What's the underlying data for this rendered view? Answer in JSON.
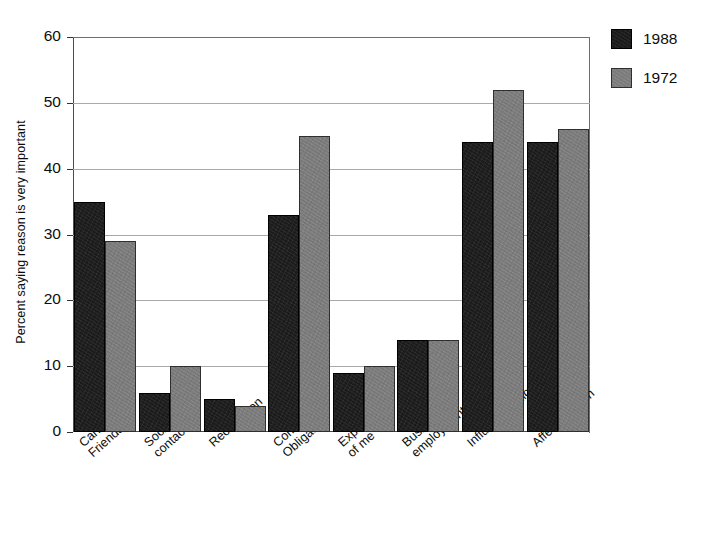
{
  "chart_data": {
    "type": "bar",
    "title": "",
    "xlabel": "",
    "ylabel": "Percent saying reason is very important",
    "ylim": [
      0,
      60
    ],
    "ytick_labels": [
      "0",
      "10",
      "20",
      "30",
      "40",
      "50",
      "60"
    ],
    "ytick_values": [
      0,
      10,
      20,
      30,
      40,
      50,
      60
    ],
    "grid": "horizontal",
    "legend_position": "right-top",
    "categories": [
      "Candidate Friendship",
      "Social contact",
      "Recognition",
      "Community Obligation",
      "Expected of me",
      "Business or employment",
      "Influence policy",
      "Affect election"
    ],
    "category_lines": [
      [
        "Candidate",
        "Friendship"
      ],
      [
        "Social",
        "contact"
      ],
      [
        "Recognition",
        ""
      ],
      [
        "Community",
        "Obligation"
      ],
      [
        "Expected",
        "of me"
      ],
      [
        "Business or",
        "employment"
      ],
      [
        "Influence policy",
        ""
      ],
      [
        "Affect election",
        ""
      ]
    ],
    "series": [
      {
        "name": "1988",
        "color": "#1b1b1b",
        "values": [
          35,
          6,
          5,
          33,
          9,
          14,
          44,
          44
        ]
      },
      {
        "name": "1972",
        "color": "#7b7b7b",
        "values": [
          29,
          10,
          4,
          45,
          10,
          14,
          52,
          46
        ]
      }
    ]
  },
  "legend": {
    "items": [
      {
        "label": "1988",
        "swatch": "black-square-swatch"
      },
      {
        "label": "1972",
        "swatch": "gray-square-swatch"
      }
    ]
  },
  "axes": {
    "y_title": "Percent saying reason is very important"
  }
}
